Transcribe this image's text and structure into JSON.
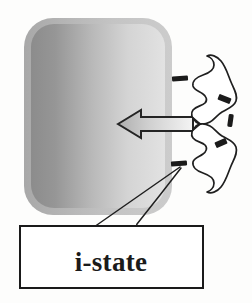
{
  "figure": {
    "background_color": "#fdfdfc"
  },
  "cell_body": {
    "name": "rounded-rectangle-body",
    "gradient_from": "#8f8f8f",
    "gradient_to": "#dedede",
    "border_color": "#b3b3b3",
    "x": 26,
    "y": 20,
    "width": 142,
    "height": 192,
    "corner_radius": 26
  },
  "arrow": {
    "name": "left-block-arrow",
    "direction": "left",
    "fill_from": "#b5b5b5",
    "fill_to": "#f2f2f2",
    "stroke_color": "#2a2a2a",
    "x": 118,
    "y": 110,
    "width": 76,
    "height": 28
  },
  "squiggle": {
    "name": "receptor-squiggle",
    "stroke_color": "#222222",
    "fill_color": "#ffffff",
    "description": "hand-drawn wavy ribbon receptor outline"
  },
  "marks": [
    {
      "name": "i-state-mark-upper-left",
      "x": 172,
      "y": 76,
      "width": 16,
      "height": 5,
      "angle": -4,
      "color": "#1b1b1b"
    },
    {
      "name": "i-state-mark-upper-right",
      "x": 218,
      "y": 96,
      "width": 13,
      "height": 6,
      "angle": 22,
      "color": "#1b1b1b"
    },
    {
      "name": "i-state-mark-middle-right",
      "x": 228,
      "y": 114,
      "width": 5,
      "height": 13,
      "angle": 8,
      "color": "#1b1b1b"
    },
    {
      "name": "i-state-mark-lower-right",
      "x": 215,
      "y": 140,
      "width": 12,
      "height": 6,
      "angle": -24,
      "color": "#1b1b1b"
    },
    {
      "name": "i-state-mark-lower-left",
      "x": 171,
      "y": 161,
      "width": 16,
      "height": 5,
      "angle": -5,
      "color": "#1b1b1b"
    }
  ],
  "leader_lines": [
    {
      "name": "leader-line-left",
      "from_x": 94,
      "from_y": 227,
      "to_x": 180,
      "to_y": 166
    },
    {
      "name": "leader-line-right",
      "from_x": 135,
      "from_y": 227,
      "to_x": 182,
      "to_y": 167
    }
  ],
  "label_box": {
    "name": "i-state-label-box",
    "text": "i-state",
    "x": 20,
    "y": 226,
    "width": 183,
    "height": 62,
    "border_color": "#1a1a1a",
    "fill_color": "#ffffff",
    "text_color": "#1a1a1a"
  }
}
